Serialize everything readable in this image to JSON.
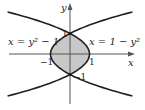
{
  "figure": {
    "type": "diagram",
    "axes": {
      "x_label": "x",
      "y_label": "y"
    },
    "curves": [
      {
        "name": "left-parabola",
        "equation_label": "x = y² − 1",
        "a": 1,
        "b": -1
      },
      {
        "name": "right-parabola",
        "equation_label": "x = 1 − y²",
        "a": -1,
        "b": 1
      }
    ],
    "tick_labels": {
      "y_pos_one": "1",
      "y_neg_one": "−1",
      "x_neg_one": "−1",
      "x_pos_one": "1"
    },
    "region": {
      "fill": "#c8c8c8",
      "description": "shaded region between curves, -1 ≤ y ≤ 1"
    },
    "colors": {
      "curve": "#231f20",
      "axis": "#555555",
      "fill": "#c8c8c8"
    }
  },
  "chart_data": {
    "type": "diagram",
    "title": "",
    "xlabel": "x",
    "ylabel": "y",
    "xlim": [
      -3.2,
      3.3
    ],
    "ylim": [
      -2.5,
      2.5
    ],
    "series": [
      {
        "name": "x = y^2 - 1",
        "y_range": [
          -2.05,
          2.05
        ]
      },
      {
        "name": "x = 1 - y^2",
        "y_range": [
          -2.05,
          2.05
        ]
      }
    ],
    "intersections": [
      [
        0,
        1
      ],
      [
        0,
        -1
      ]
    ],
    "vertices": [
      [
        -1,
        0
      ],
      [
        1,
        0
      ]
    ],
    "shaded_region": "between x = y^2 - 1 and x = 1 - y^2 for -1 <= y <= 1"
  }
}
